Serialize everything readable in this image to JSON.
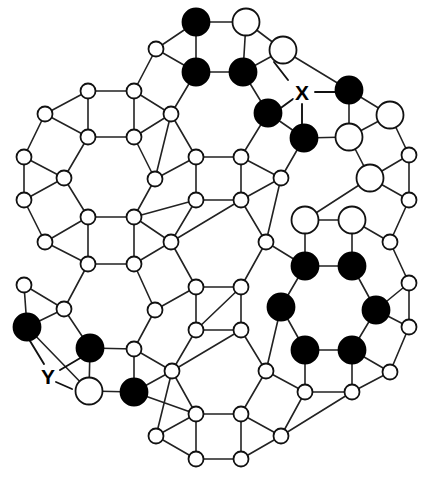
{
  "figure": {
    "type": "graph",
    "background_color": "#ffffff",
    "edge_color": "#222222",
    "node_outline_color": "#111111",
    "fill_black": "#000000",
    "fill_white": "#ffffff",
    "node_radius_small": 7.5,
    "node_radius_large": 13.5,
    "width": 432,
    "height": 482
  },
  "legend_note": "Large circles and small circles; black (filled) and white (open) vertices.",
  "labels": [
    {
      "id": "X",
      "text": "X",
      "x": 302,
      "y": 92,
      "leaders": [
        [
          288,
          80,
          274,
          62
        ],
        [
          315,
          92,
          338,
          92
        ],
        [
          302,
          104,
          302,
          126
        ],
        [
          293,
          99,
          278,
          110
        ]
      ]
    },
    {
      "id": "Y",
      "text": "Y",
      "x": 48,
      "y": 376,
      "leaders": [
        [
          44,
          364,
          27,
          336
        ],
        [
          60,
          370,
          82,
          357
        ],
        [
          56,
          382,
          72,
          389
        ]
      ]
    }
  ],
  "nodes": [
    {
      "id": "n0",
      "x": 196,
      "y": 22,
      "r": 13.5,
      "fill": "black"
    },
    {
      "id": "n1",
      "x": 246,
      "y": 22,
      "r": 13.5,
      "fill": "white"
    },
    {
      "id": "n2",
      "x": 156,
      "y": 49,
      "r": 7.5,
      "fill": "white"
    },
    {
      "id": "n3",
      "x": 196,
      "y": 72,
      "r": 13.5,
      "fill": "black"
    },
    {
      "id": "n4",
      "x": 243,
      "y": 72,
      "r": 13.5,
      "fill": "black"
    },
    {
      "id": "n5",
      "x": 283,
      "y": 50,
      "r": 13.5,
      "fill": "white"
    },
    {
      "id": "n6",
      "x": 88,
      "y": 91,
      "r": 7.5,
      "fill": "white"
    },
    {
      "id": "n7",
      "x": 134,
      "y": 91,
      "r": 7.5,
      "fill": "white"
    },
    {
      "id": "n8",
      "x": 88,
      "y": 137,
      "r": 7.5,
      "fill": "white"
    },
    {
      "id": "n9",
      "x": 134,
      "y": 137,
      "r": 7.5,
      "fill": "white"
    },
    {
      "id": "n10",
      "x": 45,
      "y": 114,
      "r": 7.5,
      "fill": "white"
    },
    {
      "id": "n11",
      "x": 171,
      "y": 114,
      "r": 7.5,
      "fill": "white"
    },
    {
      "id": "n12",
      "x": 268,
      "y": 113,
      "r": 13.5,
      "fill": "black"
    },
    {
      "id": "n13",
      "x": 304,
      "y": 138,
      "r": 13.5,
      "fill": "black"
    },
    {
      "id": "n14",
      "x": 349,
      "y": 90,
      "r": 13.5,
      "fill": "black"
    },
    {
      "id": "n15",
      "x": 390,
      "y": 115,
      "r": 13.5,
      "fill": "white"
    },
    {
      "id": "n16",
      "x": 349,
      "y": 137,
      "r": 13.5,
      "fill": "white"
    },
    {
      "id": "n17",
      "x": 24,
      "y": 157,
      "r": 7.5,
      "fill": "white"
    },
    {
      "id": "n18",
      "x": 24,
      "y": 200,
      "r": 7.5,
      "fill": "white"
    },
    {
      "id": "n19",
      "x": 64,
      "y": 178,
      "r": 7.5,
      "fill": "white"
    },
    {
      "id": "n20",
      "x": 196,
      "y": 157,
      "r": 7.5,
      "fill": "white"
    },
    {
      "id": "n21",
      "x": 241,
      "y": 157,
      "r": 7.5,
      "fill": "white"
    },
    {
      "id": "n22",
      "x": 155,
      "y": 179,
      "r": 7.5,
      "fill": "white"
    },
    {
      "id": "n23",
      "x": 281,
      "y": 178,
      "r": 7.5,
      "fill": "white"
    },
    {
      "id": "n24",
      "x": 409,
      "y": 155,
      "r": 7.5,
      "fill": "white"
    },
    {
      "id": "n25",
      "x": 370,
      "y": 178,
      "r": 13.5,
      "fill": "white"
    },
    {
      "id": "n26",
      "x": 409,
      "y": 200,
      "r": 7.5,
      "fill": "white"
    },
    {
      "id": "n27",
      "x": 196,
      "y": 200,
      "r": 7.5,
      "fill": "white"
    },
    {
      "id": "n28",
      "x": 241,
      "y": 200,
      "r": 7.5,
      "fill": "white"
    },
    {
      "id": "n29",
      "x": 88,
      "y": 217,
      "r": 7.5,
      "fill": "white"
    },
    {
      "id": "n30",
      "x": 134,
      "y": 217,
      "r": 7.5,
      "fill": "white"
    },
    {
      "id": "n31",
      "x": 45,
      "y": 242,
      "r": 7.5,
      "fill": "white"
    },
    {
      "id": "n32",
      "x": 171,
      "y": 242,
      "r": 7.5,
      "fill": "white"
    },
    {
      "id": "n33",
      "x": 88,
      "y": 264,
      "r": 7.5,
      "fill": "white"
    },
    {
      "id": "n34",
      "x": 134,
      "y": 264,
      "r": 7.5,
      "fill": "white"
    },
    {
      "id": "n35",
      "x": 266,
      "y": 242,
      "r": 7.5,
      "fill": "white"
    },
    {
      "id": "n36",
      "x": 305,
      "y": 220,
      "r": 13.5,
      "fill": "white"
    },
    {
      "id": "n37",
      "x": 352,
      "y": 220,
      "r": 13.5,
      "fill": "white"
    },
    {
      "id": "n38",
      "x": 390,
      "y": 242,
      "r": 7.5,
      "fill": "white"
    },
    {
      "id": "n39",
      "x": 305,
      "y": 266,
      "r": 13.5,
      "fill": "black"
    },
    {
      "id": "n40",
      "x": 352,
      "y": 266,
      "r": 13.5,
      "fill": "black"
    },
    {
      "id": "n41",
      "x": 409,
      "y": 283,
      "r": 7.5,
      "fill": "white"
    },
    {
      "id": "n42",
      "x": 281,
      "y": 307,
      "r": 13.5,
      "fill": "black"
    },
    {
      "id": "n43",
      "x": 376,
      "y": 310,
      "r": 13.5,
      "fill": "black"
    },
    {
      "id": "n44",
      "x": 196,
      "y": 287,
      "r": 7.5,
      "fill": "white"
    },
    {
      "id": "n45",
      "x": 241,
      "y": 287,
      "r": 7.5,
      "fill": "white"
    },
    {
      "id": "n46",
      "x": 155,
      "y": 310,
      "r": 7.5,
      "fill": "white"
    },
    {
      "id": "n47",
      "x": 24,
      "y": 285,
      "r": 7.5,
      "fill": "white"
    },
    {
      "id": "n48",
      "x": 64,
      "y": 309,
      "r": 7.5,
      "fill": "white"
    },
    {
      "id": "n49",
      "x": 196,
      "y": 330,
      "r": 7.5,
      "fill": "white"
    },
    {
      "id": "n50",
      "x": 241,
      "y": 330,
      "r": 7.5,
      "fill": "white"
    },
    {
      "id": "n51",
      "x": 27,
      "y": 327,
      "r": 13.5,
      "fill": "black"
    },
    {
      "id": "n52",
      "x": 409,
      "y": 327,
      "r": 7.5,
      "fill": "white"
    },
    {
      "id": "n53",
      "x": 90,
      "y": 348,
      "r": 13.5,
      "fill": "black"
    },
    {
      "id": "n54",
      "x": 134,
      "y": 349,
      "r": 7.5,
      "fill": "white"
    },
    {
      "id": "n55",
      "x": 305,
      "y": 350,
      "r": 13.5,
      "fill": "black"
    },
    {
      "id": "n56",
      "x": 352,
      "y": 350,
      "r": 13.5,
      "fill": "black"
    },
    {
      "id": "n57",
      "x": 89,
      "y": 391,
      "r": 13.5,
      "fill": "white"
    },
    {
      "id": "n58",
      "x": 134,
      "y": 392,
      "r": 13.5,
      "fill": "black"
    },
    {
      "id": "n59",
      "x": 172,
      "y": 371,
      "r": 7.5,
      "fill": "white"
    },
    {
      "id": "n60",
      "x": 266,
      "y": 371,
      "r": 7.5,
      "fill": "white"
    },
    {
      "id": "n61",
      "x": 390,
      "y": 372,
      "r": 7.5,
      "fill": "white"
    },
    {
      "id": "n62",
      "x": 305,
      "y": 392,
      "r": 7.5,
      "fill": "white"
    },
    {
      "id": "n63",
      "x": 352,
      "y": 392,
      "r": 7.5,
      "fill": "white"
    },
    {
      "id": "n64",
      "x": 196,
      "y": 414,
      "r": 7.5,
      "fill": "white"
    },
    {
      "id": "n65",
      "x": 241,
      "y": 414,
      "r": 7.5,
      "fill": "white"
    },
    {
      "id": "n66",
      "x": 156,
      "y": 436,
      "r": 7.5,
      "fill": "white"
    },
    {
      "id": "n67",
      "x": 281,
      "y": 436,
      "r": 7.5,
      "fill": "white"
    },
    {
      "id": "n68",
      "x": 196,
      "y": 459,
      "r": 7.5,
      "fill": "white"
    },
    {
      "id": "n69",
      "x": 241,
      "y": 459,
      "r": 7.5,
      "fill": "white"
    }
  ],
  "edges": [
    [
      "n0",
      "n1"
    ],
    [
      "n0",
      "n2"
    ],
    [
      "n0",
      "n3"
    ],
    [
      "n1",
      "n4"
    ],
    [
      "n1",
      "n5"
    ],
    [
      "n2",
      "n3"
    ],
    [
      "n2",
      "n7"
    ],
    [
      "n3",
      "n4"
    ],
    [
      "n3",
      "n11"
    ],
    [
      "n4",
      "n5"
    ],
    [
      "n4",
      "n12"
    ],
    [
      "n5",
      "n14"
    ],
    [
      "n6",
      "n7"
    ],
    [
      "n6",
      "n8"
    ],
    [
      "n6",
      "n10"
    ],
    [
      "n7",
      "n9"
    ],
    [
      "n7",
      "n11"
    ],
    [
      "n8",
      "n9"
    ],
    [
      "n8",
      "n10"
    ],
    [
      "n8",
      "n19"
    ],
    [
      "n9",
      "n11"
    ],
    [
      "n9",
      "n22"
    ],
    [
      "n10",
      "n17"
    ],
    [
      "n11",
      "n20"
    ],
    [
      "n11",
      "n22"
    ],
    [
      "n12",
      "n13"
    ],
    [
      "n12",
      "n21"
    ],
    [
      "n13",
      "n16"
    ],
    [
      "n13",
      "n23"
    ],
    [
      "n14",
      "n15"
    ],
    [
      "n14",
      "n16"
    ],
    [
      "n15",
      "n16"
    ],
    [
      "n15",
      "n24"
    ],
    [
      "n16",
      "n25"
    ],
    [
      "n17",
      "n18"
    ],
    [
      "n17",
      "n19"
    ],
    [
      "n18",
      "n19"
    ],
    [
      "n18",
      "n31"
    ],
    [
      "n19",
      "n29"
    ],
    [
      "n20",
      "n21"
    ],
    [
      "n20",
      "n22"
    ],
    [
      "n20",
      "n27"
    ],
    [
      "n21",
      "n23"
    ],
    [
      "n21",
      "n28"
    ],
    [
      "n22",
      "n30"
    ],
    [
      "n23",
      "n28"
    ],
    [
      "n23",
      "n35"
    ],
    [
      "n24",
      "n25"
    ],
    [
      "n24",
      "n26"
    ],
    [
      "n25",
      "n26"
    ],
    [
      "n25",
      "n36"
    ],
    [
      "n26",
      "n38"
    ],
    [
      "n27",
      "n28"
    ],
    [
      "n27",
      "n30"
    ],
    [
      "n27",
      "n32"
    ],
    [
      "n28",
      "n32"
    ],
    [
      "n29",
      "n30"
    ],
    [
      "n29",
      "n31"
    ],
    [
      "n29",
      "n33"
    ],
    [
      "n30",
      "n32"
    ],
    [
      "n30",
      "n34"
    ],
    [
      "n31",
      "n33"
    ],
    [
      "n32",
      "n34"
    ],
    [
      "n32",
      "n44"
    ],
    [
      "n33",
      "n34"
    ],
    [
      "n33",
      "n48"
    ],
    [
      "n34",
      "n46"
    ],
    [
      "n35",
      "n39"
    ],
    [
      "n35",
      "n45"
    ],
    [
      "n35",
      "n28"
    ],
    [
      "n36",
      "n37"
    ],
    [
      "n36",
      "n39"
    ],
    [
      "n37",
      "n38"
    ],
    [
      "n37",
      "n40"
    ],
    [
      "n38",
      "n41"
    ],
    [
      "n39",
      "n40"
    ],
    [
      "n39",
      "n42"
    ],
    [
      "n40",
      "n43"
    ],
    [
      "n41",
      "n43"
    ],
    [
      "n41",
      "n52"
    ],
    [
      "n42",
      "n55"
    ],
    [
      "n42",
      "n60"
    ],
    [
      "n43",
      "n56"
    ],
    [
      "n43",
      "n52"
    ],
    [
      "n44",
      "n45"
    ],
    [
      "n44",
      "n46"
    ],
    [
      "n44",
      "n49"
    ],
    [
      "n45",
      "n49"
    ],
    [
      "n45",
      "n50"
    ],
    [
      "n46",
      "n54"
    ],
    [
      "n47",
      "n48"
    ],
    [
      "n47",
      "n51"
    ],
    [
      "n48",
      "n51"
    ],
    [
      "n48",
      "n53"
    ],
    [
      "n49",
      "n50"
    ],
    [
      "n49",
      "n59"
    ],
    [
      "n50",
      "n60"
    ],
    [
      "n50",
      "n59"
    ],
    [
      "n51",
      "n57"
    ],
    [
      "n52",
      "n61"
    ],
    [
      "n53",
      "n54"
    ],
    [
      "n53",
      "n57"
    ],
    [
      "n54",
      "n58"
    ],
    [
      "n54",
      "n59"
    ],
    [
      "n55",
      "n56"
    ],
    [
      "n55",
      "n62"
    ],
    [
      "n56",
      "n61"
    ],
    [
      "n56",
      "n63"
    ],
    [
      "n57",
      "n58"
    ],
    [
      "n58",
      "n59"
    ],
    [
      "n58",
      "n64"
    ],
    [
      "n59",
      "n64"
    ],
    [
      "n60",
      "n62"
    ],
    [
      "n60",
      "n65"
    ],
    [
      "n61",
      "n63"
    ],
    [
      "n62",
      "n63"
    ],
    [
      "n62",
      "n67"
    ],
    [
      "n64",
      "n65"
    ],
    [
      "n64",
      "n66"
    ],
    [
      "n64",
      "n68"
    ],
    [
      "n65",
      "n67"
    ],
    [
      "n65",
      "n69"
    ],
    [
      "n66",
      "n68"
    ],
    [
      "n67",
      "n69"
    ],
    [
      "n68",
      "n69"
    ],
    [
      "n66",
      "n59"
    ],
    [
      "n63",
      "n67"
    ]
  ]
}
